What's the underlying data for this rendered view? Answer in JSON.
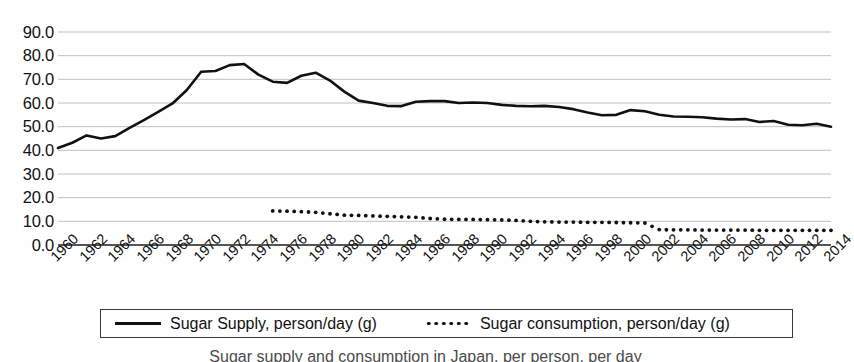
{
  "chart_data": {
    "type": "line",
    "title": "",
    "xlabel": "",
    "ylabel": "",
    "ylim": [
      0,
      90
    ],
    "xlim": [
      1960,
      2014
    ],
    "grid": true,
    "legend_position": "bottom",
    "ytick_labels": [
      "90.0",
      "80.0",
      "70.0",
      "60.0",
      "50.0",
      "40.0",
      "30.0",
      "20.0",
      "10.0",
      "0.0"
    ],
    "ytick_values": [
      90,
      80,
      70,
      60,
      50,
      40,
      30,
      20,
      10,
      0
    ],
    "xtick_labels": [
      "1960",
      "1962",
      "1964",
      "1966",
      "1968",
      "1970",
      "1972",
      "1974",
      "1976",
      "1978",
      "1980",
      "1982",
      "1984",
      "1986",
      "1988",
      "1990",
      "1992",
      "1994",
      "1996",
      "1998",
      "2000",
      "2002",
      "2004",
      "2006",
      "2008",
      "2010",
      "2012",
      "2014"
    ],
    "xtick_values": [
      1960,
      1962,
      1964,
      1966,
      1968,
      1970,
      1972,
      1974,
      1976,
      1978,
      1980,
      1982,
      1984,
      1986,
      1988,
      1990,
      1992,
      1994,
      1996,
      1998,
      2000,
      2002,
      2004,
      2006,
      2008,
      2010,
      2012,
      2014
    ],
    "x": [
      1960,
      1961,
      1962,
      1963,
      1964,
      1965,
      1966,
      1967,
      1968,
      1969,
      1970,
      1971,
      1972,
      1973,
      1974,
      1975,
      1976,
      1977,
      1978,
      1979,
      1980,
      1981,
      1982,
      1983,
      1984,
      1985,
      1986,
      1987,
      1988,
      1989,
      1990,
      1991,
      1992,
      1993,
      1994,
      1995,
      1996,
      1997,
      1998,
      1999,
      2000,
      2001,
      2002,
      2003,
      2004,
      2005,
      2006,
      2007,
      2008,
      2009,
      2010,
      2011,
      2012,
      2013,
      2014
    ],
    "series": [
      {
        "name": "Sugar Supply, person/day (g)",
        "style": "solid",
        "color": "#111111",
        "x": [
          1960,
          1961,
          1962,
          1963,
          1964,
          1965,
          1966,
          1967,
          1968,
          1969,
          1970,
          1971,
          1972,
          1973,
          1974,
          1975,
          1976,
          1977,
          1978,
          1979,
          1980,
          1981,
          1982,
          1983,
          1984,
          1985,
          1986,
          1987,
          1988,
          1989,
          1990,
          1991,
          1992,
          1993,
          1994,
          1995,
          1996,
          1997,
          1998,
          1999,
          2000,
          2001,
          2002,
          2003,
          2004,
          2005,
          2006,
          2007,
          2008,
          2009,
          2010,
          2011,
          2012,
          2013,
          2014
        ],
        "values": [
          41.0,
          43.2,
          46.3,
          45.0,
          46.0,
          49.5,
          52.8,
          56.2,
          59.8,
          65.5,
          73.2,
          73.5,
          76.0,
          76.5,
          72.0,
          69.0,
          68.5,
          71.5,
          72.8,
          69.5,
          64.8,
          61.0,
          60.0,
          58.8,
          58.7,
          60.5,
          60.8,
          60.8,
          60.0,
          60.2,
          60.0,
          59.2,
          58.8,
          58.6,
          58.8,
          58.3,
          57.4,
          56.0,
          54.8,
          55.0,
          57.0,
          56.5,
          55.0,
          54.3,
          54.2,
          54.0,
          53.4,
          53.0,
          53.2,
          52.0,
          52.4,
          50.8,
          50.6,
          51.2,
          50.0
        ]
      },
      {
        "name": "Sugar consumption, person/day (g)",
        "style": "dotted",
        "color": "#111111",
        "x": [
          1975,
          1976,
          1977,
          1978,
          1979,
          1980,
          1981,
          1982,
          1983,
          1984,
          1985,
          1986,
          1987,
          1988,
          1989,
          1990,
          1991,
          1992,
          1993,
          1994,
          1995,
          1996,
          1997,
          1998,
          1999,
          2000,
          2001,
          2002,
          2003,
          2004,
          2005,
          2006,
          2007,
          2008,
          2009,
          2010,
          2011,
          2012,
          2013,
          2014
        ],
        "values": [
          14.4,
          14.3,
          14.1,
          13.8,
          13.2,
          12.6,
          12.5,
          12.3,
          12.1,
          11.9,
          11.7,
          11.2,
          10.9,
          10.8,
          10.8,
          10.7,
          10.6,
          10.4,
          10.0,
          9.8,
          9.7,
          9.7,
          9.6,
          9.6,
          9.5,
          9.4,
          9.3,
          6.5,
          6.4,
          6.4,
          6.3,
          6.3,
          6.3,
          6.3,
          6.2,
          6.2,
          6.2,
          6.2,
          6.2,
          6.2
        ]
      }
    ]
  },
  "legend": {
    "items": [
      {
        "label": "Sugar Supply, person/day (g)",
        "marker": "solid-line-swatch"
      },
      {
        "label": "Sugar consumption, person/day (g)",
        "marker": "dotted-line-swatch"
      }
    ]
  },
  "caption": {
    "text": "Sugar supply and consumption in Japan, per person, per day"
  },
  "colors": {
    "series": "#111111",
    "gridline": "#b9b9b9",
    "axis": "#555555",
    "background": "#ffffff"
  }
}
